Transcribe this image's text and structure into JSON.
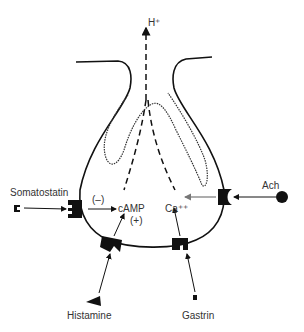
{
  "diagram": {
    "output_label": "H⁺",
    "second_messengers": {
      "camp": "cAMP",
      "calcium": "Ca⁺⁺"
    },
    "effects": {
      "inhibit": "(–)",
      "stimulate": "(+)"
    },
    "ligands": [
      {
        "name": "Somatostatin",
        "effect": "inhibit",
        "target": "cAMP"
      },
      {
        "name": "Histamine",
        "effect": "stimulate",
        "target": "cAMP"
      },
      {
        "name": "Gastrin",
        "effect": "stimulate",
        "target": "Ca++"
      },
      {
        "name": "Ach",
        "effect": "stimulate",
        "target": "Ca++"
      }
    ],
    "colors": {
      "line": "#111111",
      "text": "#333333",
      "background": "#ffffff"
    }
  }
}
